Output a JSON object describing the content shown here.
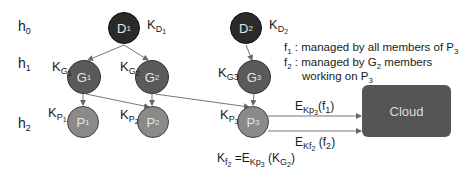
{
  "levels": [
    {
      "label": "h",
      "sub": "0"
    },
    {
      "label": "h",
      "sub": "1"
    },
    {
      "label": "h",
      "sub": "2"
    }
  ],
  "nodes": {
    "D1": {
      "label": "D",
      "sub": "1",
      "key": "K",
      "key_sub": "D",
      "key_subsub": "1"
    },
    "D2": {
      "label": "D",
      "sub": "2",
      "key": "K",
      "key_sub": "D",
      "key_subsub": "2"
    },
    "G1": {
      "label": "G",
      "sub": "1",
      "key": "K",
      "key_sub": "G",
      "key_subsub": "1"
    },
    "G2": {
      "label": "G",
      "sub": "2",
      "key": "K",
      "key_sub": "G",
      "key_subsub": "2"
    },
    "G3": {
      "label": "G",
      "sub": "3",
      "key": "K",
      "key_sub": "G3"
    },
    "P1": {
      "label": "P",
      "sub": "1",
      "key": "K",
      "key_sub": "P",
      "key_subsub": "1"
    },
    "P2": {
      "label": "P",
      "sub": "2",
      "key": "K",
      "key_sub": "P",
      "key_subsub": "2"
    },
    "P3": {
      "label": "P",
      "sub": "3",
      "key": "K",
      "key_sub": "P",
      "key_subsub": "3"
    }
  },
  "cloud": {
    "label": "Cloud"
  },
  "edges_labels": {
    "f1": {
      "E": "E",
      "key": "Kp",
      "key_sub": "3",
      "arg": "(f",
      "arg_sub": "1",
      "close": ")"
    },
    "f2": {
      "E": "E",
      "key": "Kf",
      "key_sub": "2",
      "arg": " (f",
      "arg_sub": "2",
      "close": ")"
    }
  },
  "formula": {
    "lhs": "K",
    "lhs_sub": "f",
    "lhs_subsub": "2",
    "eq": " =E",
    "key": "Kp",
    "key_sub": "3",
    "arg": " (K",
    "arg_sub": "G",
    "arg_subsub": "2",
    "close": ")"
  },
  "notes": [
    {
      "name": "f",
      "sub": "1",
      "text": " : managed by all members of P",
      "tail_sub": "3"
    },
    {
      "name": "f",
      "sub": "2",
      "text": " : managed by G",
      "mid_sub": "2",
      "text2": " members"
    },
    {
      "text": "working on P",
      "tail_sub": "3"
    }
  ],
  "colors": {
    "dark": "#2a2a2a",
    "mid": "#5a5a5a",
    "light": "#8a8a8a",
    "cloud": "#555555",
    "edge": "#666666"
  }
}
